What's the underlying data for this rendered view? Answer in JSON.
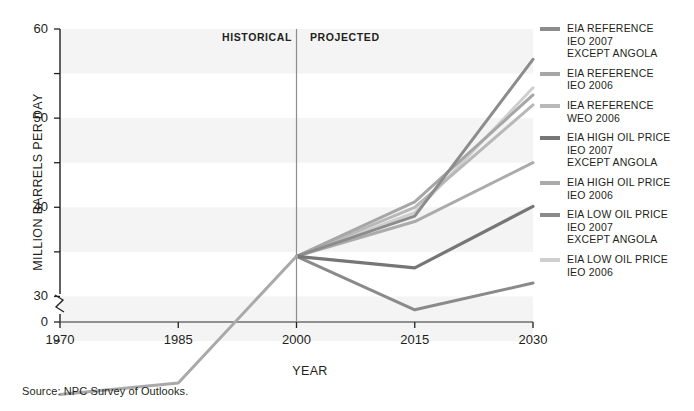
{
  "figure": {
    "source_note": "Source:  NPC Survey of Outlooks.",
    "annotations": [
      {
        "name": "historical-label",
        "text": "HISTORICAL",
        "x": 222,
        "y": 31
      },
      {
        "name": "projected-label",
        "text": "PROJECTED",
        "x": 310,
        "y": 31
      }
    ],
    "divider_year": 2000
  },
  "chart_data": {
    "type": "line",
    "title": "",
    "xlabel": "YEAR",
    "ylabel": "MILLION BARRELS PER DAY",
    "x": [
      1970,
      1985,
      2000,
      2015,
      2030
    ],
    "xtick_labels": [
      "1970",
      "1985",
      "2000",
      "2015",
      "2030"
    ],
    "xlim": [
      1970,
      2030
    ],
    "ylim": [
      25,
      60
    ],
    "y_axis_break": true,
    "y_break_from": 0,
    "y_break_to": 25,
    "ytick_values": [
      25,
      30,
      35,
      40,
      45,
      50,
      55,
      60
    ],
    "ytick_labeled": [
      0,
      30,
      40,
      50,
      60
    ],
    "ytick_labels": [
      "0",
      "30",
      "40",
      "50",
      "60"
    ],
    "grid": "horizontal-bands",
    "legend_position": "right",
    "historical_series": {
      "name": "HISTORICAL",
      "color": "#a9a9a9",
      "x": [
        1970,
        1985,
        2000
      ],
      "values": [
        19.0,
        20.3,
        34.5
      ]
    },
    "series": [
      {
        "name": "EIA REFERENCE\nIEO 2007\nEXCEPT ANGOLA",
        "color": "#8c8c8c",
        "width": 3.0,
        "x": [
          2000,
          2015,
          2030
        ],
        "values": [
          34.5,
          39.0,
          56.6
        ]
      },
      {
        "name": "EIA REFERENCE\nIEO 2006",
        "color": "#a6a6a6",
        "width": 3.0,
        "x": [
          2000,
          2015,
          2030
        ],
        "values": [
          34.5,
          40.6,
          52.6
        ]
      },
      {
        "name": "IEA REFERENCE\nWEO 2006",
        "color": "#b8b8b8",
        "width": 3.0,
        "x": [
          2000,
          2015,
          2030
        ],
        "values": [
          34.5,
          40.0,
          51.5
        ]
      },
      {
        "name": "EIA HIGH OIL PRICE\nIEO 2007\nEXCEPT ANGOLA",
        "color": "#767676",
        "width": 3.2,
        "x": [
          2000,
          2015,
          2030
        ],
        "values": [
          34.5,
          33.2,
          40.1
        ]
      },
      {
        "name": "EIA HIGH OIL PRICE\nIEO 2006",
        "color": "#ababab",
        "width": 3.0,
        "x": [
          2000,
          2015,
          2030
        ],
        "values": [
          34.5,
          38.4,
          45.0
        ]
      },
      {
        "name": "EIA LOW OIL PRICE\nIEO 2007\nEXCEPT ANGOLA",
        "color": "#8a8a8a",
        "width": 3.0,
        "x": [
          2000,
          2015,
          2030
        ],
        "values": [
          34.5,
          28.5,
          31.5
        ]
      },
      {
        "name": "EIA LOW OIL PRICE\nIEO 2006",
        "color": "#cfcfcf",
        "width": 3.0,
        "x": [
          2000,
          2015,
          2030
        ],
        "values": [
          34.5,
          39.4,
          53.4
        ]
      }
    ]
  }
}
